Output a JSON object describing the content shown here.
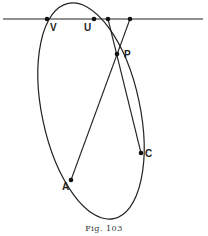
{
  "figure": {
    "caption": "Fig. 103",
    "labels": {
      "V": "V",
      "U": "U",
      "P": "P",
      "C": "C",
      "A": "A"
    },
    "elements": {
      "line": "horizontal line",
      "conic": "ellipse",
      "chords": [
        "line through top point and C via P",
        "line through top point and A via P"
      ]
    }
  }
}
